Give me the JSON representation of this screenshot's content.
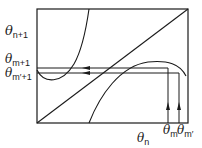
{
  "diagram": {
    "type": "cobweb-map",
    "labels": {
      "y_theta_n1": {
        "sym": "θ",
        "sub": "n+1"
      },
      "y_theta_m1": {
        "sym": "θ",
        "sub": "m+1"
      },
      "y_theta_mp1": {
        "sym": "θ",
        "sub": "m′+1"
      },
      "x_theta_n": {
        "sym": "θ",
        "sub": "n"
      },
      "x_theta_m": {
        "sym": "θ",
        "sub": "m"
      },
      "x_theta_mp": {
        "sym": "θ",
        "sub": "m′"
      }
    },
    "colors": {
      "stroke": "#1a1a1a",
      "background": "#ffffff"
    }
  }
}
